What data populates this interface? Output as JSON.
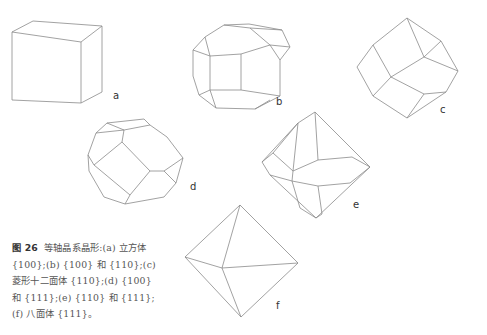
{
  "figure": {
    "number": "图 26",
    "caption_text": "等轴晶系晶形:(a) 立方体 {100};(b) {100} 和 {110};(c) 菱形十二面体 {110};(d) {100} 和 {111};(e) {110} 和 {111};(f) 八面体 {111}。"
  },
  "panels": [
    {
      "id": "a",
      "label": "a",
      "shape": "cube",
      "form": "{100}"
    },
    {
      "id": "b",
      "label": "b",
      "shape": "cube + rhombic dodecahedron",
      "form": "{100} + {110}"
    },
    {
      "id": "c",
      "label": "c",
      "shape": "rhombic dodecahedron",
      "form": "{110}"
    },
    {
      "id": "d",
      "label": "d",
      "shape": "cube + octahedron",
      "form": "{100} + {111}"
    },
    {
      "id": "e",
      "label": "e",
      "shape": "rhombic dodecahedron + octahedron",
      "form": "{110} + {111}"
    },
    {
      "id": "f",
      "label": "f",
      "shape": "octahedron",
      "form": "{111}"
    }
  ],
  "colors": {
    "line": "#8a8a8a",
    "text": "#555555",
    "background": "#ffffff"
  }
}
